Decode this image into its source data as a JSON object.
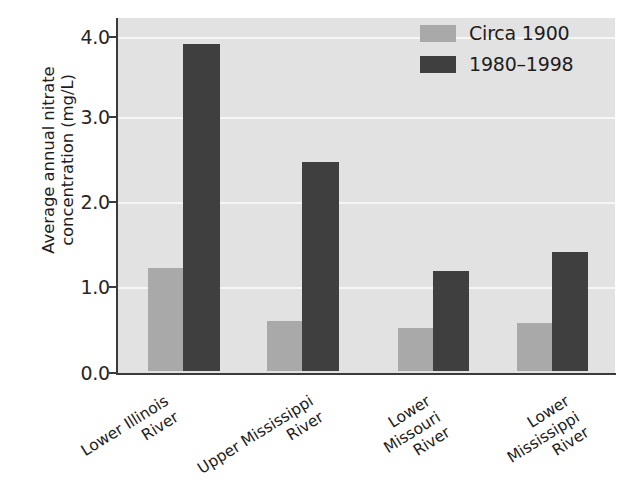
{
  "chart_data": {
    "type": "bar",
    "title": "",
    "xlabel": "",
    "ylabel": "Average annual nitrate\nconcentration (mg/L)",
    "categories": [
      "Lower Illinois\nRiver",
      "Upper Mississippi\nRiver",
      "Lower\nMissouri\nRiver",
      "Lower\nMississippi\nRiver"
    ],
    "series": [
      {
        "name": "Circa 1900",
        "color": "#a9a9a9",
        "values": [
          1.28,
          0.62,
          0.54,
          0.6
        ]
      },
      {
        "name": "1980–1998",
        "color": "#3f3f3f",
        "values": [
          4.07,
          2.6,
          1.25,
          1.48
        ]
      }
    ],
    "ylim": [
      0.0,
      4.2
    ],
    "yticks": [
      "0.0",
      "1.0",
      "2.0",
      "3.0",
      "4.0"
    ],
    "ytick_values": [
      0.0,
      1.0,
      2.0,
      3.0,
      4.0
    ],
    "grid": true,
    "grid_color": "#f6f6f6",
    "plot_background": "#e2e2e2",
    "legend_position": "top-right"
  },
  "legend": {
    "items": [
      {
        "label": "Circa 1900",
        "color": "#a9a9a9"
      },
      {
        "label": "1980–1998",
        "color": "#3f3f3f"
      }
    ]
  },
  "axes": {
    "y_title": "Average annual nitrate\nconcentration (mg/L)",
    "y_ticks": [
      "4.0",
      "3.0",
      "2.0",
      "1.0",
      "0.0"
    ],
    "x_ticks": [
      "Lower Illinois\nRiver",
      "Upper Mississippi\nRiver",
      "Lower\nMissouri\nRiver",
      "Lower\nMississippi\nRiver"
    ]
  }
}
